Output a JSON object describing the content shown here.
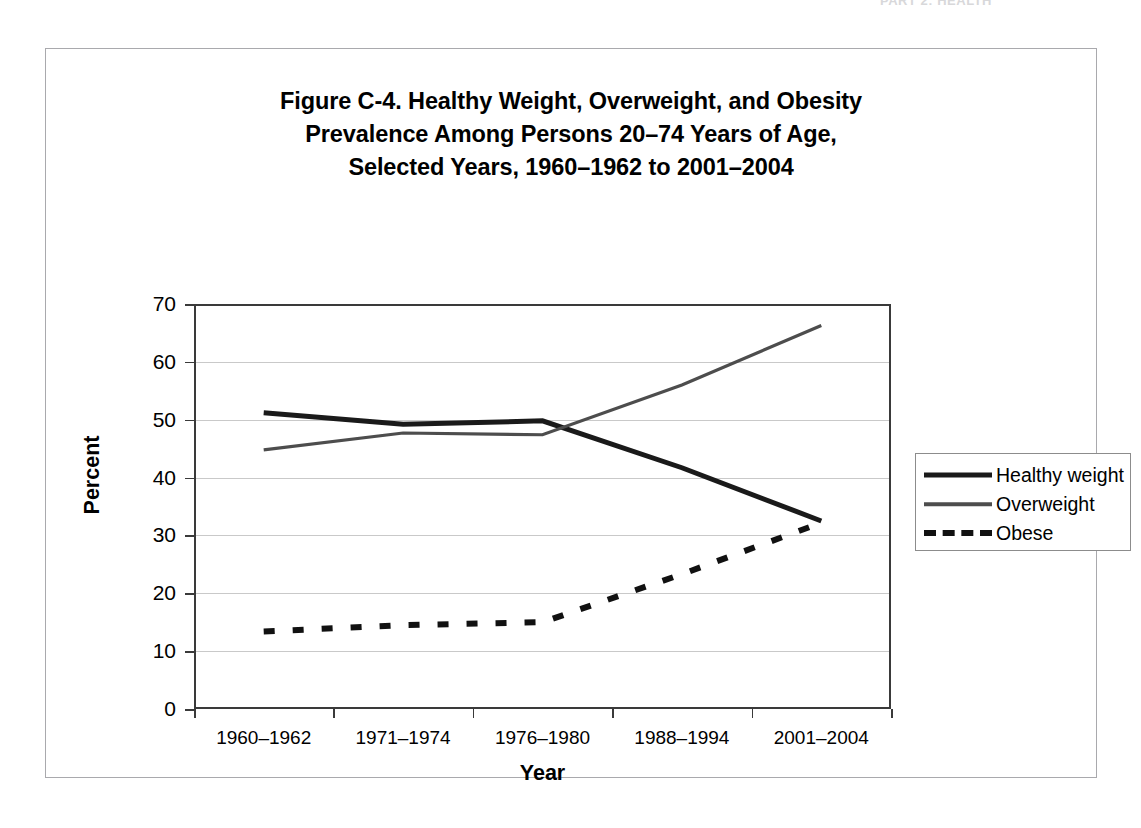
{
  "running_header": "PART 2: HEALTH",
  "figure": {
    "title_lines": [
      "Figure C-4. Healthy Weight, Overweight, and Obesity",
      "Prevalence Among Persons 20–74 Years of Age,",
      "Selected Years, 1960–1962 to 2001–2004"
    ]
  },
  "chart_data": {
    "type": "line",
    "title": "Figure C-4. Healthy Weight, Overweight, and Obesity Prevalence Among Persons 20–74 Years of Age, Selected Years, 1960–1962 to 2001–2004",
    "xlabel": "Year",
    "ylabel": "Percent",
    "categories": [
      "1960–1962",
      "1971–1974",
      "1976–1980",
      "1988–1994",
      "2001–2004"
    ],
    "ylim": [
      0,
      70
    ],
    "ytick_values": [
      0,
      10,
      20,
      30,
      40,
      50,
      60,
      70
    ],
    "ytick_labels": [
      "0",
      "10",
      "20",
      "30",
      "40",
      "50",
      "60",
      "70"
    ],
    "grid": "horizontal",
    "legend_position": "right",
    "series": [
      {
        "name": "Healthy weight",
        "style": "solid",
        "color": "#1a1a1a",
        "width": 5,
        "values": [
          51.2,
          49.2,
          49.8,
          41.7,
          32.5
        ]
      },
      {
        "name": "Overweight",
        "style": "solid",
        "color": "#4d4d4d",
        "width": 3.2,
        "values": [
          44.8,
          47.7,
          47.4,
          56.0,
          66.3
        ]
      },
      {
        "name": "Obese",
        "style": "dashed",
        "color": "#111111",
        "width": 6,
        "values": [
          13.4,
          14.5,
          15.0,
          23.3,
          32.2
        ]
      }
    ]
  }
}
